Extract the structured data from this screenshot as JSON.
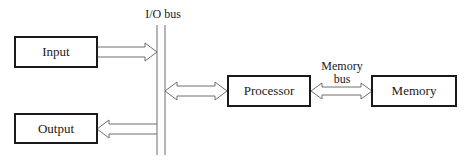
{
  "diagram": {
    "bus_label": "I/O bus",
    "memory_bus_label_line1": "Memory",
    "memory_bus_label_line2": "bus",
    "nodes": {
      "input": "Input",
      "output": "Output",
      "processor": "Processor",
      "memory": "Memory"
    },
    "edges": [
      {
        "from": "Input",
        "to": "I/O bus",
        "direction": "one-way"
      },
      {
        "from": "I/O bus",
        "to": "Output",
        "direction": "one-way"
      },
      {
        "from": "I/O bus",
        "to": "Processor",
        "direction": "two-way"
      },
      {
        "from": "Processor",
        "to": "Memory",
        "direction": "two-way",
        "label": "Memory bus"
      }
    ]
  }
}
